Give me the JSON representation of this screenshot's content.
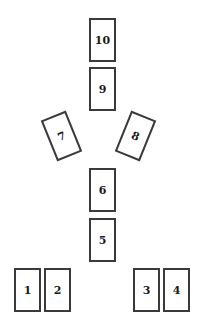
{
  "diagram": {
    "name": "card-spread-layout",
    "background_color": "#ffffff",
    "card_fill_color": "#ffffff",
    "card_border_color": "#3a3a3a",
    "label_color": "#1a1a1a",
    "width": 207,
    "height": 327,
    "card_width": 27,
    "card_height": 44,
    "cards": [
      {
        "label": "10",
        "x": 89,
        "y": 18,
        "w": 27,
        "h": 44,
        "rotation": 0,
        "position": "top-column-upper"
      },
      {
        "label": "9",
        "x": 89,
        "y": 67,
        "w": 27,
        "h": 44,
        "rotation": 0,
        "position": "top-column-lower"
      },
      {
        "label": "7",
        "x": 48,
        "y": 114,
        "w": 27,
        "h": 44,
        "rotation": -22,
        "position": "left-tilted"
      },
      {
        "label": "8",
        "x": 122,
        "y": 114,
        "w": 27,
        "h": 44,
        "rotation": 22,
        "position": "right-tilted"
      },
      {
        "label": "6",
        "x": 89,
        "y": 168,
        "w": 27,
        "h": 44,
        "rotation": 0,
        "position": "center-column-upper"
      },
      {
        "label": "5",
        "x": 89,
        "y": 218,
        "w": 27,
        "h": 44,
        "rotation": 0,
        "position": "center-column-lower"
      },
      {
        "label": "1",
        "x": 14,
        "y": 268,
        "w": 27,
        "h": 44,
        "rotation": 0,
        "position": "bottom-left-1"
      },
      {
        "label": "2",
        "x": 44,
        "y": 268,
        "w": 27,
        "h": 44,
        "rotation": 0,
        "position": "bottom-left-2"
      },
      {
        "label": "3",
        "x": 133,
        "y": 268,
        "w": 27,
        "h": 44,
        "rotation": 0,
        "position": "bottom-right-3"
      },
      {
        "label": "4",
        "x": 163,
        "y": 268,
        "w": 27,
        "h": 44,
        "rotation": 0,
        "position": "bottom-right-4"
      }
    ]
  }
}
